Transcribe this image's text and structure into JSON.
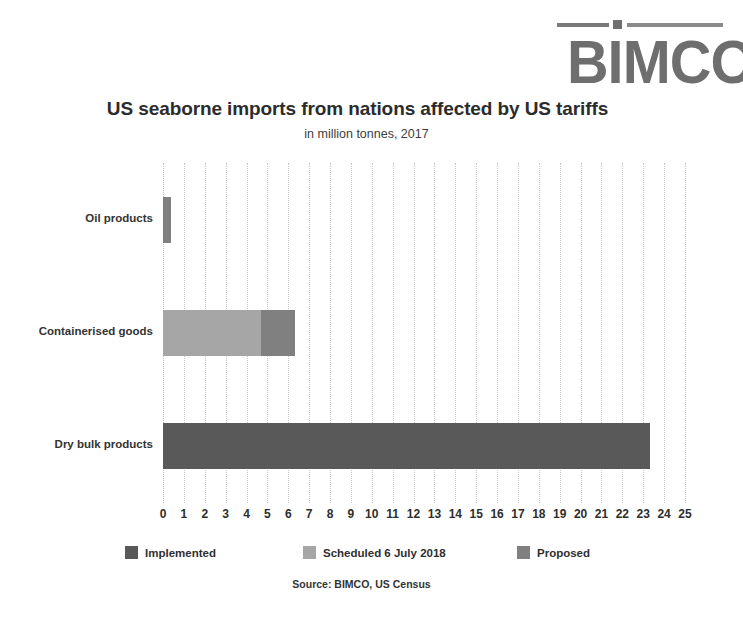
{
  "logo": {
    "wordmark": "BIMCO",
    "rule_icon": "logo-rule-icon"
  },
  "header": {
    "title": "US seaborne imports from nations affected by US tariffs",
    "subtitle": "in million tonnes, 2017"
  },
  "source": "Source: BIMCO, US Census",
  "colors": {
    "implemented": "#595959",
    "scheduled": "#a6a6a6",
    "proposed": "#808080",
    "gridline": "#c9c9c9",
    "text": "#2f2f2f",
    "background": "#ffffff"
  },
  "legend": {
    "position": "bottom",
    "items": [
      {
        "label": "Implemented",
        "color": "#595959",
        "swatch_icon": "legend-swatch-implemented"
      },
      {
        "label": "Scheduled 6 July 2018",
        "color": "#a6a6a6",
        "swatch_icon": "legend-swatch-scheduled"
      },
      {
        "label": "Proposed",
        "color": "#808080",
        "swatch_icon": "legend-swatch-proposed"
      }
    ]
  },
  "chart_data": {
    "type": "bar",
    "orientation": "horizontal",
    "stacked": true,
    "title": "US seaborne imports from nations affected by US tariffs",
    "subtitle": "in million tonnes, 2017",
    "xlabel": "",
    "ylabel": "",
    "xlim": [
      0,
      25
    ],
    "xticks": [
      0,
      1,
      2,
      3,
      4,
      5,
      6,
      7,
      8,
      9,
      10,
      11,
      12,
      13,
      14,
      15,
      16,
      17,
      18,
      19,
      20,
      21,
      22,
      23,
      24,
      25
    ],
    "xtick_labels": [
      "0",
      "1",
      "2",
      "3",
      "4",
      "5",
      "6",
      "7",
      "8",
      "9",
      "10",
      "11",
      "12",
      "13",
      "14",
      "15",
      "16",
      "17",
      "18",
      "19",
      "20",
      "21",
      "22",
      "23",
      "24",
      "25"
    ],
    "grid": true,
    "grid_axis": "x",
    "categories": [
      "Oil products",
      "Containerised goods",
      "Dry bulk products"
    ],
    "series": [
      {
        "name": "Implemented",
        "color": "#595959",
        "values": [
          0,
          0,
          23.3
        ]
      },
      {
        "name": "Scheduled 6 July 2018",
        "color": "#a6a6a6",
        "values": [
          0,
          4.7,
          0
        ]
      },
      {
        "name": "Proposed",
        "color": "#808080",
        "values": [
          0.4,
          1.6,
          0
        ]
      }
    ],
    "totals": [
      0.4,
      6.3,
      23.3
    ],
    "units": "million tonnes",
    "year": 2017
  }
}
